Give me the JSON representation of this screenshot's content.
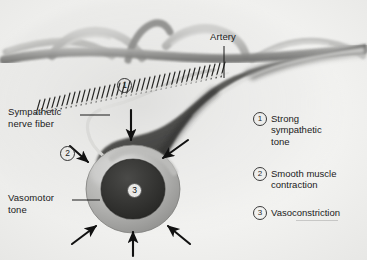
{
  "figure": {
    "background_color": "#f2f2f0",
    "ink_color": "#1a1a1a"
  },
  "callouts": {
    "artery": {
      "label": "Artery"
    },
    "sympathetic_nerve_fiber": {
      "line1": "Sympathetic",
      "line2": "nerve fiber"
    },
    "vasomotor_tone": {
      "line1": "Vasomotor",
      "line2": "tone"
    }
  },
  "markers": {
    "one": "1",
    "two": "2",
    "three": "3"
  },
  "legend": {
    "items": [
      {
        "number": "1",
        "text": "Strong\nsympathetic\ntone"
      },
      {
        "number": "2",
        "text": "Smooth muscle\ncontraction"
      },
      {
        "number": "3",
        "text": "Vasoconstriction"
      }
    ]
  },
  "colors": {
    "vessel_dark": "#3c3c3c",
    "vessel_mid": "#6e6e6e",
    "vessel_light": "#b9b9b7",
    "lumen": "#333333",
    "wall_ring": "#b0b0ae",
    "arrow": "#111111",
    "nerve": "#d8d8d6"
  }
}
